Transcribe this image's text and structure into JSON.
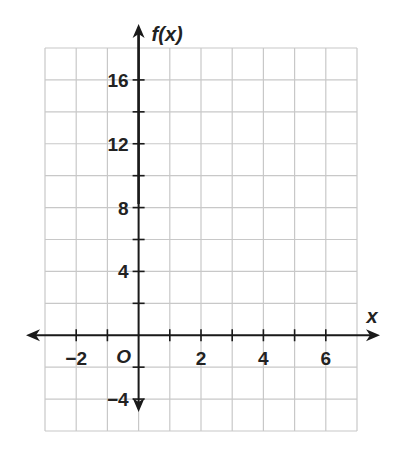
{
  "chart_data": {
    "type": "line",
    "title": "",
    "xlabel": "x",
    "ylabel": "f(x)",
    "origin_label": "O",
    "xlim": [
      -3,
      7
    ],
    "ylim": [
      -6,
      18
    ],
    "x_grid_step": 1,
    "y_grid_step": 2,
    "grid": true,
    "x_ticks": [
      -2,
      -1,
      0,
      1,
      2,
      3,
      4,
      5,
      6
    ],
    "x_tick_labels": [
      {
        "value": -2,
        "label": "−2"
      },
      {
        "value": 2,
        "label": "2"
      },
      {
        "value": 4,
        "label": "4"
      },
      {
        "value": 6,
        "label": "6"
      }
    ],
    "y_tick_labels": [
      {
        "value": 16,
        "label": "16"
      },
      {
        "value": 12,
        "label": "12"
      },
      {
        "value": 8,
        "label": "8"
      },
      {
        "value": 4,
        "label": "4"
      },
      {
        "value": -4,
        "label": "−4"
      }
    ],
    "series": []
  },
  "colors": {
    "axis": "#1a1a1a",
    "grid": "#c8c8c8",
    "text": "#222222"
  }
}
